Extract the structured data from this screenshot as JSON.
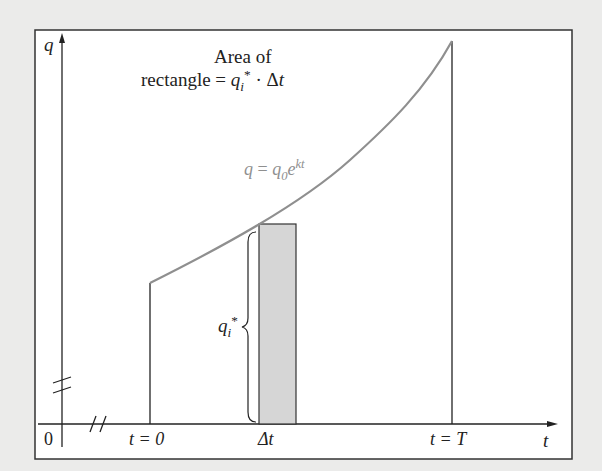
{
  "diagram": {
    "title_line1": "Area of",
    "title_line2_prefix": "rectangle = ",
    "title_q": "q",
    "title_q_sub": "i",
    "title_q_sup": "*",
    "title_dot_dt": " · Δ",
    "title_t": "t",
    "y_axis_label": "q",
    "x_axis_label": "t",
    "origin_label": "0",
    "tick_start": "t = 0",
    "tick_mid": "Δt",
    "tick_end": "t = T",
    "curve_label": {
      "q": "q",
      "eq": " = ",
      "q0": "q",
      "q0_sub": "0",
      "e": "e",
      "exp": "kt"
    },
    "height_label": {
      "q": "q",
      "sub": "i",
      "sup": "*"
    },
    "colors": {
      "background": "#ebebea",
      "frame": "#ffffff",
      "axis": "#222222",
      "curve": "#8f8f8f",
      "rectangle_fill": "#d6d6d6"
    }
  }
}
